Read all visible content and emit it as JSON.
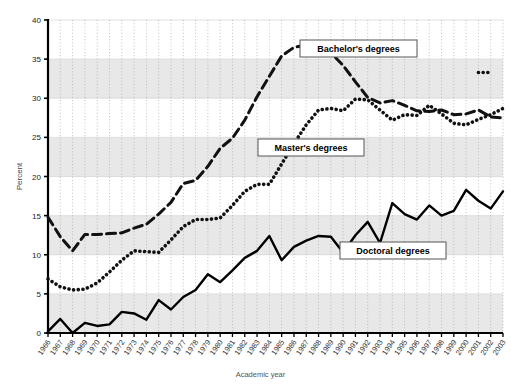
{
  "chart_data": {
    "type": "line",
    "title": "",
    "xlabel": "Academic year",
    "ylabel": "Percent",
    "ylim": [
      0,
      40
    ],
    "yticks": [
      0,
      5,
      10,
      15,
      20,
      25,
      30,
      35,
      40
    ],
    "grid": "vertical dotted gridlines at each year; alternating horizontal shaded bands every 5 percent",
    "legend_position": "inline annotation boxes",
    "categories": [
      "1966",
      "1967",
      "1968",
      "1969",
      "1970",
      "1971",
      "1972",
      "1973",
      "1974",
      "1975",
      "1976",
      "1977",
      "1978",
      "1979",
      "1980",
      "1981",
      "1982",
      "1983",
      "1984",
      "1985",
      "1986",
      "1987",
      "1988",
      "1989",
      "1990",
      "1991",
      "1992",
      "1993",
      "1994",
      "1995",
      "1996",
      "1997",
      "1998",
      "1999",
      "2000",
      "2001",
      "2002",
      "2003"
    ],
    "series": [
      {
        "name": "Bachelor's degrees",
        "style": "dashed",
        "color": "#111111",
        "values": [
          14.8,
          12.3,
          10.5,
          12.6,
          12.6,
          12.7,
          12.8,
          13.4,
          13.9,
          15.2,
          16.7,
          19.1,
          19.5,
          21.3,
          23.6,
          24.9,
          27.2,
          30.2,
          32.8,
          35.4,
          36.5,
          36.8,
          36.6,
          35.8,
          34.2,
          32.1,
          30.1,
          29.4,
          29.7,
          29.1,
          28.4,
          28.3,
          28.5,
          27.9,
          28.0,
          28.5,
          27.6,
          27.5
        ]
      },
      {
        "name": "Master's degrees",
        "style": "dotted",
        "color": "#111111",
        "values": [
          6.9,
          5.9,
          5.5,
          5.6,
          6.4,
          7.8,
          9.3,
          10.5,
          10.4,
          10.3,
          11.9,
          13.6,
          14.5,
          14.5,
          14.7,
          16.3,
          18.1,
          19.0,
          19.0,
          21.6,
          24.2,
          26.6,
          28.5,
          28.7,
          28.4,
          29.9,
          29.8,
          28.5,
          27.2,
          27.9,
          27.8,
          29.1,
          28.0,
          26.8,
          26.6,
          27.3,
          27.9,
          28.7
        ]
      },
      {
        "name": "Master's degrees (later points)",
        "style": "dotted",
        "color": "#111111",
        "x": [
          "2001",
          "2002"
        ],
        "values": [
          33.3,
          33.3
        ]
      },
      {
        "name": "Doctoral degrees",
        "style": "solid",
        "color": "#000000",
        "values": [
          0.2,
          1.8,
          0.0,
          1.3,
          0.9,
          1.1,
          2.7,
          2.5,
          1.7,
          4.2,
          3.0,
          4.6,
          5.5,
          7.5,
          6.5,
          8.0,
          9.6,
          10.5,
          12.4,
          9.3,
          11.0,
          11.8,
          12.4,
          12.3,
          10.3,
          12.5,
          14.2,
          11.5,
          16.6,
          15.2,
          14.5,
          16.3,
          15.0,
          15.6,
          18.3,
          16.9,
          15.9,
          18.1
        ]
      }
    ],
    "annotations": [
      {
        "label": "Bachelor's degrees",
        "x_px": 300,
        "y_px": 40
      },
      {
        "label": "Master's degrees",
        "x_px": 258,
        "y_px": 139
      },
      {
        "label": "Doctoral degrees",
        "x_px": 340,
        "y_px": 242
      }
    ]
  },
  "axes": {
    "y_title": "Percent",
    "x_title": "Academic year",
    "y_tick_labels": [
      "0",
      "5",
      "10",
      "15",
      "20",
      "25",
      "30",
      "35",
      "40"
    ],
    "x_tick_labels": [
      "1966",
      "1967",
      "1968",
      "1969",
      "1970",
      "1971",
      "1972",
      "1973",
      "1974",
      "1975",
      "1976",
      "1977",
      "1978",
      "1979",
      "1980",
      "1981",
      "1982",
      "1983",
      "1984",
      "1985",
      "1986",
      "1987",
      "1988",
      "1989",
      "1990",
      "1991",
      "1992",
      "1993",
      "1994",
      "1995",
      "1996",
      "1997",
      "1998",
      "1999",
      "2000",
      "2001",
      "2002",
      "2003"
    ]
  },
  "colors": {
    "band_shaded": "#e8e8e8",
    "band_plain": "#ffffff",
    "gridline": "#999999",
    "axis": "#000000",
    "series": "#111111"
  }
}
